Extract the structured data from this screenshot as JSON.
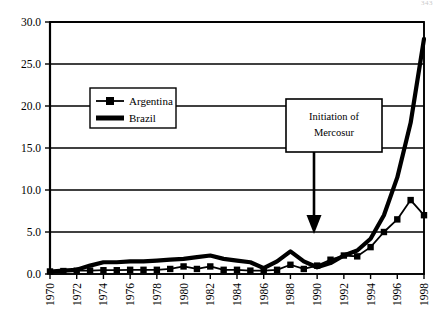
{
  "page": {
    "number": "343"
  },
  "chart_data": {
    "type": "line",
    "title": "",
    "subtitle": "",
    "xlabel": "",
    "ylabel": "",
    "xlim": [
      1970,
      1998
    ],
    "ylim": [
      0.0,
      30.0
    ],
    "grid": true,
    "legend_position": "upper-left-inside",
    "ytick_labels": [
      "0.0",
      "5.0",
      "10.0",
      "15.0",
      "20.0",
      "25.0",
      "30.0"
    ],
    "ytick_values": [
      0.0,
      5.0,
      10.0,
      15.0,
      20.0,
      25.0,
      30.0
    ],
    "xtick_labels": [
      "1970",
      "1972",
      "1974",
      "1976",
      "1978",
      "1980",
      "1982",
      "1984",
      "1986",
      "1988",
      "1990",
      "1992",
      "1994",
      "1996",
      "1998"
    ],
    "xtick_values": [
      1970,
      1972,
      1974,
      1976,
      1978,
      1980,
      1982,
      1984,
      1986,
      1988,
      1990,
      1992,
      1994,
      1996,
      1998
    ],
    "x": [
      1970,
      1971,
      1972,
      1973,
      1974,
      1975,
      1976,
      1977,
      1978,
      1979,
      1980,
      1981,
      1982,
      1983,
      1984,
      1985,
      1986,
      1987,
      1988,
      1989,
      1990,
      1991,
      1992,
      1993,
      1994,
      1995,
      1996,
      1997,
      1998
    ],
    "series": [
      {
        "name": "Argentina",
        "marker": "square",
        "values": [
          0.3,
          0.35,
          0.4,
          0.4,
          0.45,
          0.45,
          0.5,
          0.5,
          0.5,
          0.6,
          0.9,
          0.6,
          0.9,
          0.5,
          0.5,
          0.4,
          0.4,
          0.5,
          1.1,
          0.6,
          1.0,
          1.7,
          2.2,
          2.1,
          3.2,
          5.0,
          6.5,
          8.8,
          7.0
        ]
      },
      {
        "name": "Brazil",
        "marker": "none",
        "values": [
          0.3,
          0.4,
          0.5,
          1.0,
          1.4,
          1.4,
          1.5,
          1.5,
          1.6,
          1.7,
          1.8,
          2.0,
          2.2,
          1.8,
          1.6,
          1.4,
          0.7,
          1.5,
          2.7,
          1.5,
          0.8,
          1.3,
          2.2,
          2.8,
          4.2,
          7.0,
          11.5,
          18.0,
          28.0
        ]
      }
    ],
    "annotations": [
      {
        "name": "mercosur-annotation",
        "text_line1": "Initiation of",
        "text_line2": "Mercosur",
        "arrow": "down",
        "points_to_year": 1991,
        "points_to_value": 5.0
      }
    ],
    "colors": {
      "argentina": "#000000",
      "brazil": "#000000",
      "axis": "#000000",
      "grid": "#000000",
      "background": "#ffffff"
    }
  }
}
